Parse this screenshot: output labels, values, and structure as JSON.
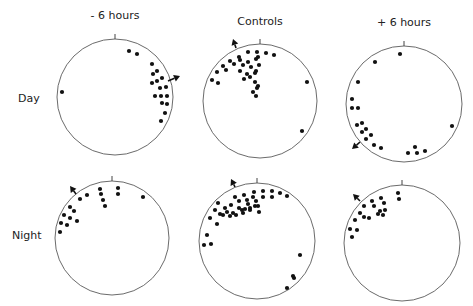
{
  "columns": [
    {
      "label": "- 6 hours",
      "x": 115,
      "y": 19
    },
    {
      "label": "Controls",
      "x": 260,
      "y": 25
    },
    {
      "label": "+ 6 hours",
      "x": 404,
      "y": 26
    }
  ],
  "rows": [
    {
      "label": "Day",
      "x": 18,
      "y": 102
    },
    {
      "label": "Night",
      "x": 12,
      "y": 239
    }
  ],
  "panels": [
    {
      "id": "day-minus6",
      "cx": 115,
      "cy": 97,
      "r": 58,
      "arrow": {
        "x1": 168,
        "y1": 81,
        "x2": 180,
        "y2": 76
      },
      "dots": [
        [
          129,
          51
        ],
        [
          137,
          54
        ],
        [
          152,
          64
        ],
        [
          157,
          71
        ],
        [
          153,
          74
        ],
        [
          162,
          78
        ],
        [
          157,
          81
        ],
        [
          152,
          83
        ],
        [
          166,
          87
        ],
        [
          160,
          88
        ],
        [
          167,
          96
        ],
        [
          161,
          96
        ],
        [
          155,
          96
        ],
        [
          167,
          104
        ],
        [
          162,
          103
        ],
        [
          165,
          113
        ],
        [
          161,
          121
        ],
        [
          62,
          92
        ]
      ]
    },
    {
      "id": "day-controls",
      "cx": 260,
      "cy": 101,
      "r": 57,
      "arrow": {
        "x1": 236,
        "y1": 48,
        "x2": 233,
        "y2": 39
      },
      "dots": [
        [
          239,
          57
        ],
        [
          248,
          52
        ],
        [
          257,
          52
        ],
        [
          258,
          57
        ],
        [
          266,
          53
        ],
        [
          274,
          55
        ],
        [
          230,
          61
        ],
        [
          240,
          60
        ],
        [
          248,
          62
        ],
        [
          256,
          59
        ],
        [
          223,
          66
        ],
        [
          234,
          64
        ],
        [
          243,
          65
        ],
        [
          251,
          67
        ],
        [
          259,
          65
        ],
        [
          217,
          72
        ],
        [
          226,
          70
        ],
        [
          240,
          71
        ],
        [
          247,
          74
        ],
        [
          256,
          71
        ],
        [
          212,
          80
        ],
        [
          218,
          83
        ],
        [
          244,
          79
        ],
        [
          250,
          77
        ],
        [
          255,
          73
        ],
        [
          255,
          82
        ],
        [
          257,
          88
        ],
        [
          253,
          92
        ],
        [
          256,
          96
        ],
        [
          258,
          86
        ],
        [
          307,
          82
        ],
        [
          302,
          131
        ]
      ]
    },
    {
      "id": "day-plus6",
      "cx": 404,
      "cy": 104,
      "r": 58,
      "arrow": {
        "x1": 360,
        "y1": 142,
        "x2": 352,
        "y2": 149
      },
      "dots": [
        [
          400,
          54
        ],
        [
          375,
          62
        ],
        [
          358,
          82
        ],
        [
          352,
          99
        ],
        [
          352,
          108
        ],
        [
          358,
          108
        ],
        [
          357,
          125
        ],
        [
          362,
          123
        ],
        [
          366,
          129
        ],
        [
          362,
          132
        ],
        [
          371,
          135
        ],
        [
          366,
          139
        ],
        [
          374,
          145
        ],
        [
          381,
          148
        ],
        [
          408,
          153
        ],
        [
          415,
          147
        ],
        [
          417,
          153
        ],
        [
          425,
          151
        ],
        [
          452,
          126
        ]
      ]
    },
    {
      "id": "night-minus6",
      "cx": 112,
      "cy": 238,
      "r": 57,
      "arrow": {
        "x1": 76,
        "y1": 194,
        "x2": 70,
        "y2": 186
      },
      "dots": [
        [
          80,
          199
        ],
        [
          87,
          195
        ],
        [
          100,
          189
        ],
        [
          101,
          194
        ],
        [
          103,
          200
        ],
        [
          105,
          206
        ],
        [
          118,
          188
        ],
        [
          118,
          194
        ],
        [
          143,
          197
        ],
        [
          70,
          207
        ],
        [
          74,
          211
        ],
        [
          64,
          215
        ],
        [
          70,
          218
        ],
        [
          77,
          221
        ],
        [
          61,
          223
        ],
        [
          67,
          225
        ],
        [
          60,
          232
        ]
      ]
    },
    {
      "id": "night-controls",
      "cx": 257,
      "cy": 241,
      "r": 58,
      "arrow": {
        "x1": 235,
        "y1": 187,
        "x2": 231,
        "y2": 179
      },
      "dots": [
        [
          254,
          192
        ],
        [
          263,
          191
        ],
        [
          263,
          197
        ],
        [
          272,
          191
        ],
        [
          272,
          197
        ],
        [
          280,
          193
        ],
        [
          287,
          196
        ],
        [
          235,
          197
        ],
        [
          244,
          195
        ],
        [
          253,
          197
        ],
        [
          239,
          201
        ],
        [
          247,
          200
        ],
        [
          218,
          203
        ],
        [
          231,
          205
        ],
        [
          239,
          208
        ],
        [
          248,
          204
        ],
        [
          256,
          201
        ],
        [
          255,
          206
        ],
        [
          215,
          210
        ],
        [
          225,
          208
        ],
        [
          233,
          213
        ],
        [
          242,
          210
        ],
        [
          250,
          208
        ],
        [
          258,
          206
        ],
        [
          223,
          215
        ],
        [
          230,
          216
        ],
        [
          236,
          215
        ],
        [
          243,
          213
        ],
        [
          245,
          209
        ],
        [
          250,
          210
        ],
        [
          259,
          212
        ],
        [
          210,
          218
        ],
        [
          220,
          214
        ],
        [
          227,
          212
        ],
        [
          217,
          224
        ],
        [
          207,
          235
        ],
        [
          204,
          245
        ],
        [
          211,
          244
        ],
        [
          300,
          255
        ],
        [
          293,
          276
        ],
        [
          294,
          278
        ],
        [
          287,
          288
        ]
      ]
    },
    {
      "id": "night-plus6",
      "cx": 402,
      "cy": 243,
      "r": 58,
      "arrow": {
        "x1": 360,
        "y1": 201,
        "x2": 353,
        "y2": 194
      },
      "dots": [
        [
          398,
          193
        ],
        [
          399,
          199
        ],
        [
          372,
          201
        ],
        [
          381,
          198
        ],
        [
          384,
          203
        ],
        [
          364,
          206
        ],
        [
          374,
          206
        ],
        [
          380,
          211
        ],
        [
          385,
          210
        ],
        [
          360,
          213
        ],
        [
          364,
          217
        ],
        [
          369,
          218
        ],
        [
          378,
          214
        ],
        [
          383,
          215
        ],
        [
          355,
          220
        ],
        [
          350,
          229
        ],
        [
          357,
          230
        ],
        [
          352,
          237
        ]
      ]
    }
  ]
}
